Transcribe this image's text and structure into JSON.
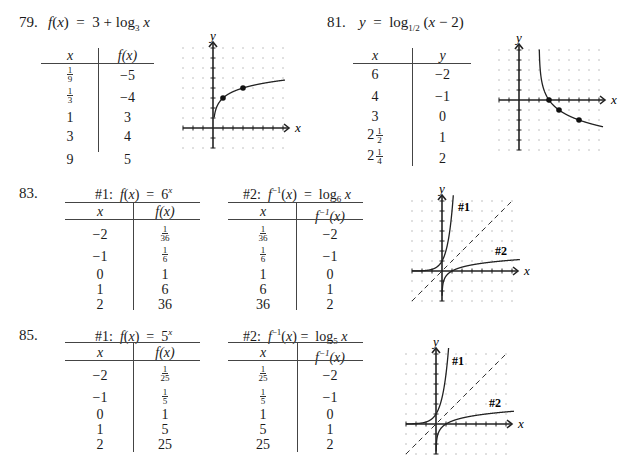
{
  "problems": [
    {
      "number": "79.",
      "equation": "f(x) = 3 + log3 x",
      "table": {
        "headers": [
          "x",
          "f(x)"
        ],
        "rows": [
          [
            "1/9",
            "-5"
          ],
          [
            "1/3",
            "-4"
          ],
          [
            "1",
            "3"
          ],
          [
            "3",
            "4"
          ],
          [
            "9",
            "5"
          ]
        ]
      },
      "graph": {
        "x_label": "x",
        "y_label": "y"
      }
    },
    {
      "number": "81.",
      "equation": "y = log1/2 (x - 2)",
      "table": {
        "headers": [
          "x",
          "y"
        ],
        "rows": [
          [
            "6",
            "-2"
          ],
          [
            "4",
            "-1"
          ],
          [
            "3",
            "0"
          ],
          [
            "2 1/2",
            "1"
          ],
          [
            "2 1/4",
            "2"
          ]
        ]
      },
      "graph": {
        "x_label": "x",
        "y_label": "y"
      }
    },
    {
      "number": "83.",
      "table1": {
        "title": "#1: f(x) = 6^x",
        "headers": [
          "x",
          "f(x)"
        ],
        "rows": [
          [
            "-2",
            "1/36"
          ],
          [
            "-1",
            "1/6"
          ],
          [
            "0",
            "1"
          ],
          [
            "1",
            "6"
          ],
          [
            "2",
            "36"
          ]
        ]
      },
      "table2": {
        "title": "#2: f^-1(x) = log6 x",
        "headers": [
          "x",
          "f^-1(x)"
        ],
        "rows": [
          [
            "1/36",
            "-2"
          ],
          [
            "1/6",
            "-1"
          ],
          [
            "1",
            "0"
          ],
          [
            "6",
            "1"
          ],
          [
            "36",
            "2"
          ]
        ]
      },
      "graph": {
        "x_label": "x",
        "y_label": "y",
        "curve1_label": "#1",
        "curve2_label": "#2"
      }
    },
    {
      "number": "85.",
      "table1": {
        "title": "#1: f(x) = 5^x",
        "headers": [
          "x",
          "f(x)"
        ],
        "rows": [
          [
            "-2",
            "1/25"
          ],
          [
            "-1",
            "1/5"
          ],
          [
            "0",
            "1"
          ],
          [
            "1",
            "5"
          ],
          [
            "2",
            "25"
          ]
        ]
      },
      "table2": {
        "title": "#2: f^-1(x) = log5 x",
        "headers": [
          "x",
          "f^-1(x)"
        ],
        "rows": [
          [
            "1/25",
            "-2"
          ],
          [
            "1/5",
            "-1"
          ],
          [
            "1",
            "0"
          ],
          [
            "5",
            "1"
          ],
          [
            "25",
            "2"
          ]
        ]
      },
      "graph": {
        "x_label": "x",
        "y_label": "y",
        "curve1_label": "#1",
        "curve2_label": "#2"
      }
    }
  ],
  "labels": {
    "p79": "79.",
    "p81": "81.",
    "p83": "83.",
    "p85": "85.",
    "minus": "−",
    "eq": "=",
    "log": "log",
    "plus": "+",
    "x": "x",
    "y": "y",
    "fx": "f(x)",
    "three": "3",
    "b3": "3",
    "b12": "1/2",
    "b6": "6",
    "b5": "5",
    "h1": "#1:",
    "h2": "#2:",
    "c1": "#1",
    "c2": "#2"
  }
}
